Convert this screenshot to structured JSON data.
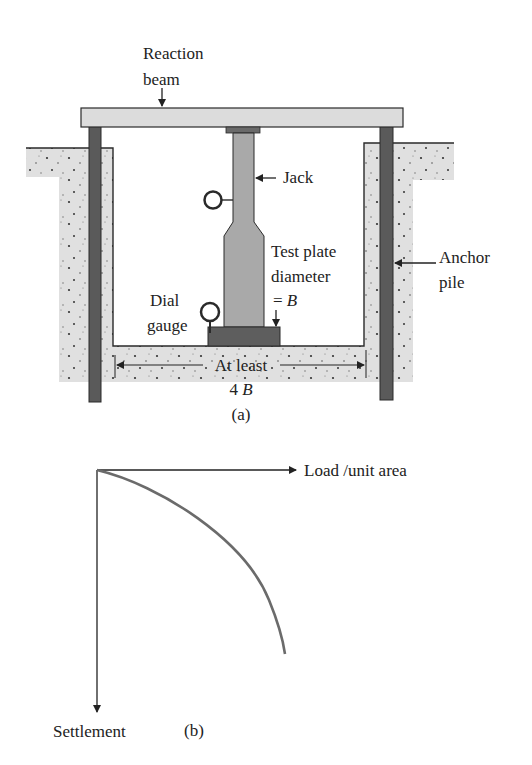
{
  "figure_a": {
    "caption": "(a)",
    "labels": {
      "reaction_beam_line1": "Reaction",
      "reaction_beam_line2": "beam",
      "jack": "Jack",
      "test_plate_line1": "Test plate",
      "test_plate_line2": "diameter",
      "test_plate_line3_prefix": "= ",
      "test_plate_line3_var": "B",
      "anchor_pile_line1": "Anchor",
      "anchor_pile_line2": "pile",
      "dial_gauge_line1": "Dial",
      "dial_gauge_line2": "gauge",
      "spacing_line1": "At least",
      "spacing_line2_num": "4 ",
      "spacing_line2_var": "B"
    },
    "colors": {
      "beam": "#dcdcdc",
      "pile": "#5a5a5a",
      "jack": "#a9a9a9",
      "plate": "#5e5e5e",
      "soil": "#e0e0e0",
      "outline": "#2a2a2a"
    }
  },
  "figure_b": {
    "caption": "(b)",
    "x_axis_label": "Load /unit area",
    "y_axis_label": "Settlement",
    "curve_color": "#6b6b6b"
  }
}
